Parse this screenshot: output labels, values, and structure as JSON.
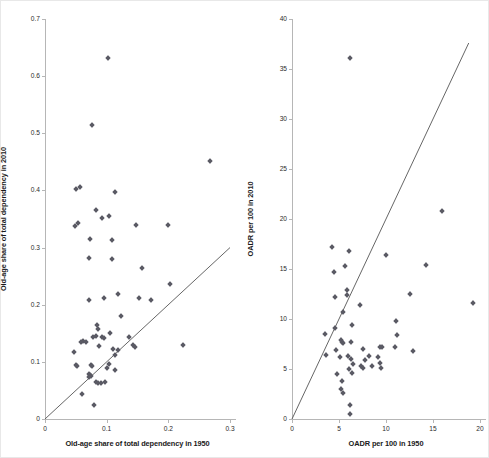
{
  "figure": {
    "background": "#ffffff",
    "marker_color": "#5a5a64",
    "axis_color": "#b6b6b6",
    "line_color": "#555555"
  },
  "chart_data": [
    {
      "type": "scatter",
      "id": "left",
      "title": "",
      "xlabel": "Old-age share of total dependency in 1950",
      "ylabel": "Old-age share of total dependency in 2010",
      "xlim": [
        0,
        0.3
      ],
      "ylim": [
        0,
        0.7
      ],
      "xticks": [
        0,
        0.1,
        0.2,
        0.3
      ],
      "xticklabels": [
        "0",
        "0.1",
        "0.2",
        "0.3"
      ],
      "yticks": [
        0,
        0.1,
        0.2,
        0.3,
        0.4,
        0.5,
        0.6,
        0.7
      ],
      "yticklabels": [
        "0",
        "0.1",
        "0.2",
        "0.3",
        "0.4",
        "0.5",
        "0.6",
        "0.7"
      ],
      "grid": false,
      "legend": "none",
      "annotations": [
        {
          "kind": "reference-line",
          "label": "45-degree identity line",
          "from": [
            0,
            0
          ],
          "to": [
            0.3,
            0.3
          ]
        }
      ],
      "points": [
        [
          0.102,
          0.632
        ],
        [
          0.077,
          0.514
        ],
        [
          0.268,
          0.452
        ],
        [
          0.05,
          0.402
        ],
        [
          0.056,
          0.406
        ],
        [
          0.114,
          0.397
        ],
        [
          0.082,
          0.365
        ],
        [
          0.092,
          0.352
        ],
        [
          0.103,
          0.355
        ],
        [
          0.053,
          0.343
        ],
        [
          0.049,
          0.338
        ],
        [
          0.148,
          0.34
        ],
        [
          0.199,
          0.339
        ],
        [
          0.073,
          0.315
        ],
        [
          0.108,
          0.313
        ],
        [
          0.071,
          0.281
        ],
        [
          0.109,
          0.28
        ],
        [
          0.158,
          0.265
        ],
        [
          0.203,
          0.237
        ],
        [
          0.118,
          0.218
        ],
        [
          0.096,
          0.211
        ],
        [
          0.072,
          0.209
        ],
        [
          0.152,
          0.212
        ],
        [
          0.172,
          0.208
        ],
        [
          0.124,
          0.181
        ],
        [
          0.085,
          0.165
        ],
        [
          0.086,
          0.158
        ],
        [
          0.105,
          0.15
        ],
        [
          0.082,
          0.145
        ],
        [
          0.078,
          0.144
        ],
        [
          0.092,
          0.143
        ],
        [
          0.096,
          0.141
        ],
        [
          0.137,
          0.143
        ],
        [
          0.062,
          0.137
        ],
        [
          0.058,
          0.135
        ],
        [
          0.066,
          0.134
        ],
        [
          0.088,
          0.128
        ],
        [
          0.143,
          0.13
        ],
        [
          0.146,
          0.126
        ],
        [
          0.224,
          0.129
        ],
        [
          0.111,
          0.122
        ],
        [
          0.118,
          0.121
        ],
        [
          0.047,
          0.118
        ],
        [
          0.113,
          0.112
        ],
        [
          0.104,
          0.096
        ],
        [
          0.05,
          0.094
        ],
        [
          0.052,
          0.092
        ],
        [
          0.074,
          0.095
        ],
        [
          0.076,
          0.092
        ],
        [
          0.1,
          0.089
        ],
        [
          0.113,
          0.086
        ],
        [
          0.071,
          0.079
        ],
        [
          0.073,
          0.077
        ],
        [
          0.074,
          0.076
        ],
        [
          0.072,
          0.073
        ],
        [
          0.082,
          0.064
        ],
        [
          0.086,
          0.063
        ],
        [
          0.09,
          0.063
        ],
        [
          0.098,
          0.064
        ],
        [
          0.06,
          0.044
        ],
        [
          0.08,
          0.025
        ]
      ]
    },
    {
      "type": "scatter",
      "id": "right",
      "title": "",
      "xlabel": "OADR per 100 in 1950",
      "ylabel": "OADR per 100 in 2010",
      "xlim": [
        0,
        20
      ],
      "ylim": [
        0,
        40
      ],
      "xticks": [
        0,
        5,
        10,
        15,
        20
      ],
      "xticklabels": [
        "0",
        "5",
        "10",
        "15",
        "20"
      ],
      "yticks": [
        0,
        5,
        10,
        15,
        20,
        25,
        30,
        35,
        40
      ],
      "yticklabels": [
        "0",
        "5",
        "10",
        "15",
        "20",
        "25",
        "30",
        "35",
        "40"
      ],
      "grid": false,
      "legend": "none",
      "annotations": [
        {
          "kind": "reference-line",
          "label": "45-degree identity line",
          "from": [
            0,
            0
          ],
          "to": [
            18.8,
            37.6
          ]
        }
      ],
      "points": [
        [
          6.2,
          36.1
        ],
        [
          16.0,
          20.8
        ],
        [
          4.3,
          17.2
        ],
        [
          6.1,
          16.8
        ],
        [
          10.0,
          16.4
        ],
        [
          14.3,
          15.4
        ],
        [
          5.6,
          15.3
        ],
        [
          4.5,
          14.7
        ],
        [
          5.8,
          12.9
        ],
        [
          12.5,
          12.5
        ],
        [
          5.9,
          12.4
        ],
        [
          4.6,
          12.2
        ],
        [
          19.3,
          11.6
        ],
        [
          7.2,
          11.4
        ],
        [
          5.4,
          10.7
        ],
        [
          11.1,
          9.8
        ],
        [
          6.4,
          9.4
        ],
        [
          4.6,
          9.1
        ],
        [
          3.5,
          8.5
        ],
        [
          11.2,
          8.4
        ],
        [
          5.2,
          7.9
        ],
        [
          5.3,
          7.7
        ],
        [
          5.4,
          7.6
        ],
        [
          6.3,
          7.7
        ],
        [
          9.4,
          7.2
        ],
        [
          9.6,
          7.2
        ],
        [
          11.0,
          7.2
        ],
        [
          7.5,
          7.0
        ],
        [
          12.9,
          6.8
        ],
        [
          4.7,
          6.9
        ],
        [
          3.6,
          6.4
        ],
        [
          5.1,
          6.2
        ],
        [
          6.0,
          6.3
        ],
        [
          8.2,
          6.3
        ],
        [
          9.2,
          6.2
        ],
        [
          6.3,
          6.0
        ],
        [
          7.8,
          5.9
        ],
        [
          9.4,
          5.6
        ],
        [
          6.5,
          5.5
        ],
        [
          7.3,
          5.3
        ],
        [
          8.5,
          5.3
        ],
        [
          7.6,
          5.1
        ],
        [
          9.5,
          5.1
        ],
        [
          6.1,
          5.0
        ],
        [
          4.8,
          4.5
        ],
        [
          6.4,
          4.6
        ],
        [
          5.3,
          3.8
        ],
        [
          5.2,
          3.0
        ],
        [
          5.4,
          2.6
        ],
        [
          6.2,
          1.4
        ],
        [
          6.2,
          0.5
        ]
      ]
    }
  ]
}
